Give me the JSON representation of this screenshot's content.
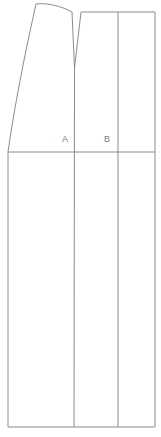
{
  "figure": {
    "background_color": "#ffffff",
    "line_color": "#8c8c8c",
    "label_color": "#7a7a7a",
    "line_width": 1,
    "width": 161,
    "height": 437
  },
  "labels": {
    "panel_a": "A",
    "panel_b": "B"
  },
  "geometry": {
    "upper_left_panel": {
      "name": "panel-a-upper",
      "top_curve_start": [
        36,
        4
      ],
      "top_curve_end": [
        72,
        12
      ],
      "left_edge_top": [
        36,
        4
      ],
      "left_edge_bottom": [
        8,
        152
      ],
      "right_edge_top": [
        72,
        12
      ],
      "right_edge_bottom": [
        74,
        68
      ],
      "waist_y": 152
    },
    "notch": {
      "name": "v-notch",
      "left_top": [
        72,
        12
      ],
      "apex": [
        74.5,
        68
      ],
      "right_top": [
        81,
        12
      ],
      "depth": 56
    },
    "upper_right_panel": {
      "name": "panel-b-upper",
      "top_left": [
        81,
        12
      ],
      "top_right": [
        155,
        12
      ],
      "right_edge_bottom": [
        155,
        152
      ],
      "interior_vertical_x": 118,
      "waist_y": 152
    },
    "waist_line": {
      "name": "waist-line",
      "from": [
        8,
        152
      ],
      "to": [
        155,
        152
      ]
    },
    "lower_block": {
      "name": "skirt-block",
      "top_left": [
        8,
        152
      ],
      "top_right": [
        155,
        152
      ],
      "bottom_left": [
        8,
        427
      ],
      "bottom_right": [
        155,
        427
      ],
      "divider_x": [
        74,
        118
      ]
    },
    "center_vertical": {
      "name": "center-front-line",
      "x_top": 74.5,
      "x_bottom": 74,
      "from_y": 68,
      "to_y": 427
    }
  }
}
